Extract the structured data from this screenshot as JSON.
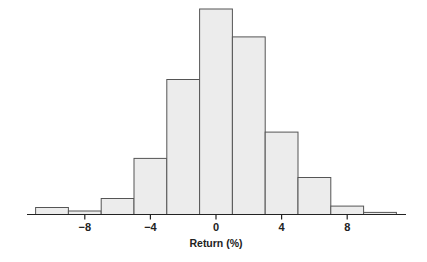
{
  "chart_data": {
    "type": "bar",
    "subtype": "histogram",
    "title": "",
    "xlabel": "Return (%)",
    "ylabel": "",
    "bin_edges": [
      -11,
      -9,
      -7,
      -5,
      -3,
      -1,
      1,
      3,
      5,
      7,
      9,
      11
    ],
    "categories": [
      "-11 to -9",
      "-9 to -7",
      "-7 to -5",
      "-5 to -3",
      "-3 to -1",
      "-1 to 1",
      "1 to 3",
      "3 to 5",
      "5 to 7",
      "7 to 9",
      "9 to 11"
    ],
    "values": [
      3.4,
      1.7,
      7.8,
      27.3,
      65.7,
      100,
      86.4,
      40.1,
      18.0,
      4.1,
      1.0
    ],
    "value_units": "relative frequency (tallest bar = 100; y-axis unlabeled)",
    "x_ticks": [
      -8,
      -4,
      0,
      4,
      8
    ],
    "x_tick_labels": [
      "−8",
      "−4",
      "0",
      "4",
      "8"
    ],
    "xlim": [
      -12,
      12
    ],
    "ylim": [
      0,
      100
    ],
    "grid": false,
    "legend": null,
    "colors": {
      "bar_fill": "#ececec",
      "bar_stroke": "#555555",
      "axis": "#222222"
    }
  }
}
